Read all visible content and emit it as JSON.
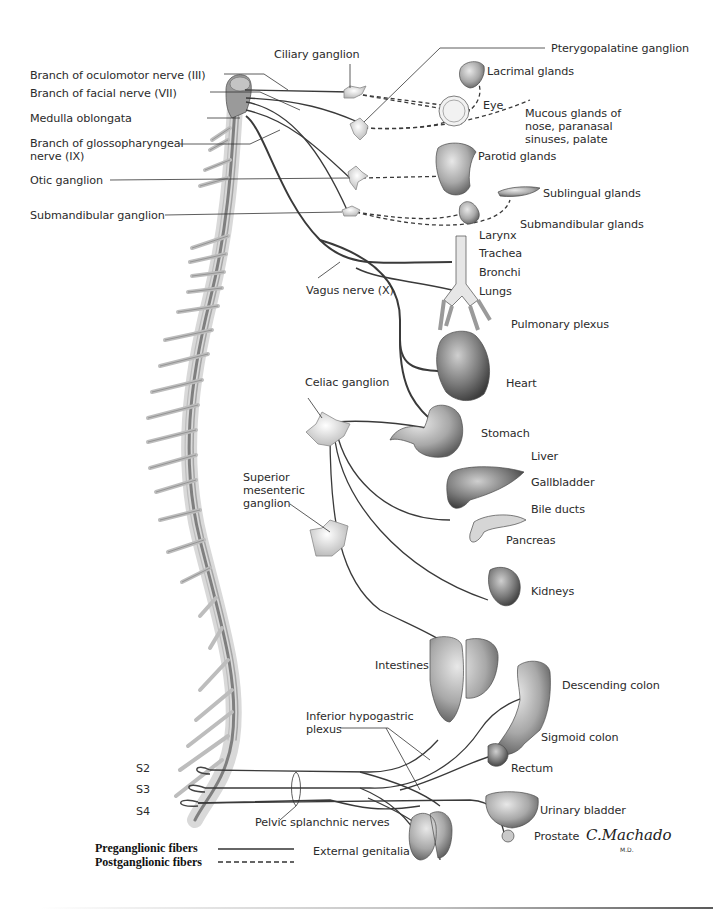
{
  "diagram": {
    "left_labels": {
      "oculomotor": "Branch of oculomotor nerve (III)",
      "facial": "Branch of facial nerve (VII)",
      "medulla": "Medulla oblongata",
      "glossopharyngeal": "Branch of glossopharyngeal\nnerve (IX)",
      "otic": "Otic ganglion",
      "submandibular_ganglion": "Submandibular ganglion"
    },
    "ganglia_labels": {
      "ciliary": "Ciliary ganglion",
      "pterygopalatine": "Pterygopalatine ganglion",
      "celiac": "Celiac ganglion",
      "superior_mesenteric": "Superior\nmesenteric\nganglion",
      "inferior_hypogastric": "Inferior hypogastric\nplexus"
    },
    "nerve_labels": {
      "vagus": "Vagus nerve (X)",
      "pelvic_splanchnic": "Pelvic splanchnic nerves"
    },
    "organ_labels": {
      "lacrimal": "Lacrimal glands",
      "eye": "Eye",
      "mucous": "Mucous glands of\nnose, paranasal\nsinuses, palate",
      "parotid": "Parotid glands",
      "sublingual": "Sublingual glands",
      "submandibular_glands": "Submandibular glands",
      "larynx": "Larynx",
      "trachea": "Trachea",
      "bronchi": "Bronchi",
      "lungs": "Lungs",
      "pulmonary_plexus": "Pulmonary plexus",
      "heart": "Heart",
      "stomach": "Stomach",
      "liver": "Liver",
      "gallbladder": "Gallbladder",
      "bile_ducts": "Bile ducts",
      "pancreas": "Pancreas",
      "kidneys": "Kidneys",
      "intestines": "Intestines",
      "descending_colon": "Descending colon",
      "sigmoid_colon": "Sigmoid colon",
      "rectum": "Rectum",
      "urinary_bladder": "Urinary bladder",
      "prostate": "Prostate",
      "external_genitalia": "External genitalia"
    },
    "sacral_levels": [
      "S2",
      "S3",
      "S4"
    ],
    "legend": {
      "preganglionic": "Preganglionic fibers",
      "postganglionic": "Postganglionic fibers"
    },
    "signature": {
      "name": "C.Machado",
      "suffix": "M.D."
    },
    "colors": {
      "preganglionic_line": "#3a3a3a",
      "postganglionic_line": "#3a3a3a",
      "spinal_cord": "#8a8a8a",
      "organ_fill": "#b9b9b9",
      "label_text": "#2b2b2b"
    }
  }
}
